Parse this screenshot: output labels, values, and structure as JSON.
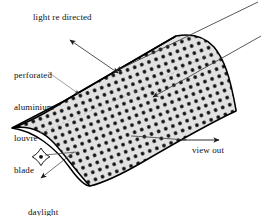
{
  "figure": {
    "background_color": "#ffffff",
    "line_color": "#000000",
    "blade_fill_color": "#e2e2e2",
    "perforation_color": "#000000"
  },
  "labels": {
    "light_redirected": "light re directed",
    "blade_line1": "perforated",
    "blade_line2": "aluminium",
    "blade_line3": "louvre",
    "blade_line4": "blade",
    "view_out": "view out",
    "daylight_line1": "daylight",
    "daylight_line2": "entry"
  },
  "icons": {
    "sun": "sun-sparkle-icon",
    "incoming_ray": "incoming-light-ray-icon",
    "redirect_arrow": "redirected-light-arrow-icon",
    "view_arrow": "view-out-arrow-icon",
    "daylight_arrow": "daylight-entry-arrow-icon",
    "leader": "leader-line-icon"
  }
}
